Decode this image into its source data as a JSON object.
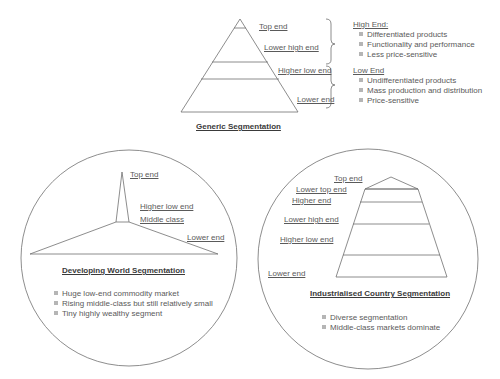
{
  "generic": {
    "title": "Generic Segmentation",
    "levels": [
      "Top end",
      "Lower high end",
      "Higher low end",
      "Lower end"
    ],
    "high_end": {
      "heading": "High End:",
      "items": [
        "Differentiated products",
        "Functionality and performance",
        "Less price-sensitive"
      ]
    },
    "low_end": {
      "heading": "Low End",
      "items": [
        "Undifferentiated products",
        "Mass production and distribution",
        "Price-sensitive"
      ]
    }
  },
  "developing": {
    "title": "Developing World Segmentation",
    "levels": [
      "Top end",
      "Higher low end",
      "Middle class",
      "Lower end"
    ],
    "items": [
      "Huge low-end commodity market",
      "Rising middle-class but still relatively small",
      "Tiny highly wealthy segment"
    ]
  },
  "industrialised": {
    "title": "Industrialised Country Segmentation",
    "levels": [
      "Top end",
      "Lower top end",
      "Higher end",
      "Lower high end",
      "Higher low end",
      "Lower  end"
    ],
    "items": [
      "Diverse segmentation",
      "Middle-class markets dominate"
    ]
  },
  "colors": {
    "line": "#707070",
    "text": "#5a5a5a",
    "title": "#3a3a3a",
    "bullet": "#b5b5b5"
  }
}
